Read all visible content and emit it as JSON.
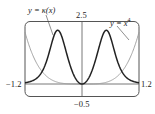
{
  "chart_data": {
    "type": "line",
    "title": "",
    "xlabel": "",
    "ylabel": "",
    "xlim": [
      -1.2,
      1.2
    ],
    "ylim": [
      -0.5,
      2.5
    ],
    "grid": false,
    "legend": "none (inline annotations with leader lines)",
    "tick_labels": {
      "x_min": "-1.2",
      "x_max": "1.2",
      "y_min": "-0.5",
      "y_max": "2.5"
    },
    "series": [
      {
        "name": "y = κ(x)",
        "formula": "12x^2 / (1 + 16x^6)^(3/2)",
        "style": "thick dark",
        "color": "#222222",
        "x": [
          -1.2,
          -1.0,
          -0.8,
          -0.6,
          -0.511,
          -0.4,
          -0.2,
          0.0,
          0.2,
          0.4,
          0.511,
          0.6,
          0.8,
          1.0,
          1.2
        ],
        "values": [
          0.08,
          0.17,
          0.71,
          1.89,
          2.15,
          1.75,
          0.47,
          0.0,
          0.47,
          1.75,
          2.15,
          1.89,
          0.71,
          0.17,
          0.08
        ]
      },
      {
        "name": "y = x^4",
        "formula": "x^4",
        "style": "thin gray",
        "color": "#9a9a9a",
        "x": [
          -1.2,
          -1.0,
          -0.8,
          -0.6,
          -0.4,
          -0.2,
          0.0,
          0.2,
          0.4,
          0.6,
          0.8,
          1.0,
          1.2
        ],
        "values": [
          2.07,
          1.0,
          0.41,
          0.13,
          0.03,
          0.0,
          0.0,
          0.0,
          0.03,
          0.13,
          0.41,
          1.0,
          2.07
        ]
      }
    ],
    "annotations": [
      "y = κ(x)",
      "y = x⁴"
    ]
  },
  "labels": {
    "kappa_label": "y = κ(x)",
    "x4_prefix": "y = x",
    "x4_exp": "4",
    "y_max": "2.5",
    "y_min": "−0.5",
    "x_min": "−1.2",
    "x_max": "1.2"
  },
  "colors": {
    "kappa": "#222222",
    "x4": "#9a9a9a",
    "frame": "#555555",
    "axis": "#555555"
  }
}
